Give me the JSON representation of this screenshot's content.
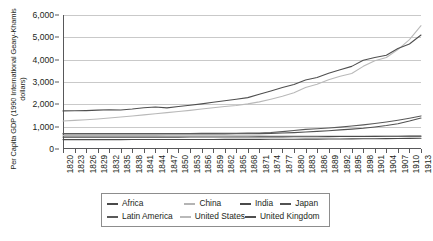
{
  "chart_data": {
    "type": "line",
    "title": "",
    "xlabel": "",
    "ylabel": "Per Capita GDP (1990 International Geary-Khamis dollars)",
    "ylim": [
      0,
      6000
    ],
    "xlim": [
      1820,
      1913
    ],
    "grid": true,
    "legend_position": "bottom",
    "y_ticks": [
      "0",
      "1,000",
      "2,000",
      "3,000",
      "4,000",
      "5,000",
      "6,000"
    ],
    "y_tick_values": [
      0,
      1000,
      2000,
      3000,
      4000,
      5000,
      6000
    ],
    "categories": [
      "1820",
      "1823",
      "1826",
      "1829",
      "1832",
      "1835",
      "1838",
      "1841",
      "1844",
      "1847",
      "1850",
      "1853",
      "1856",
      "1859",
      "1862",
      "1865",
      "1868",
      "1871",
      "1874",
      "1877",
      "1880",
      "1883",
      "1886",
      "1889",
      "1892",
      "1895",
      "1898",
      "1901",
      "1904",
      "1907",
      "1910",
      "1913"
    ],
    "series": [
      {
        "name": "Africa",
        "color": "#4a4a4a",
        "values": [
          420,
          420,
          421,
          421,
          422,
          422,
          423,
          424,
          424,
          425,
          425,
          426,
          427,
          428,
          429,
          430,
          431,
          432,
          434,
          436,
          438,
          440,
          442,
          445,
          448,
          452,
          456,
          460,
          465,
          470,
          475,
          480
        ]
      },
      {
        "name": "China",
        "color": "#b4b4b4",
        "values": [
          600,
          600,
          600,
          600,
          599,
          599,
          598,
          598,
          597,
          596,
          595,
          594,
          593,
          592,
          590,
          589,
          587,
          586,
          584,
          583,
          582,
          580,
          579,
          578,
          577,
          576,
          575,
          574,
          573,
          572,
          571,
          570
        ]
      },
      {
        "name": "India",
        "color": "#4a4a4a",
        "values": [
          533,
          533,
          533,
          533,
          533,
          533,
          533,
          533,
          533,
          533,
          533,
          534,
          535,
          536,
          537,
          538,
          540,
          541,
          543,
          545,
          547,
          549,
          551,
          554,
          557,
          560,
          563,
          566,
          569,
          572,
          575,
          577
        ]
      },
      {
        "name": "Japan",
        "color": "#525252",
        "values": [
          669,
          669,
          669,
          669,
          669,
          669,
          669,
          669,
          669,
          669,
          669,
          670,
          672,
          675,
          678,
          682,
          686,
          690,
          700,
          715,
          735,
          760,
          790,
          820,
          855,
          890,
          930,
          985,
          1050,
          1130,
          1250,
          1387
        ]
      },
      {
        "name": "Latin America",
        "color": "#5a5a5a",
        "values": [
          692,
          692,
          692,
          692,
          692,
          692,
          692,
          692,
          692,
          693,
          694,
          696,
          698,
          700,
          703,
          706,
          710,
          715,
          740,
          780,
          830,
          880,
          910,
          940,
          980,
          1030,
          1080,
          1140,
          1210,
          1290,
          1380,
          1481
        ]
      },
      {
        "name": "United States",
        "color": "#b9b9b9",
        "values": [
          1257,
          1280,
          1310,
          1345,
          1385,
          1430,
          1480,
          1530,
          1580,
          1630,
          1680,
          1730,
          1790,
          1850,
          1900,
          1950,
          2020,
          2110,
          2230,
          2360,
          2520,
          2750,
          2900,
          3100,
          3260,
          3380,
          3700,
          3950,
          4100,
          4450,
          4900,
          5520
        ]
      },
      {
        "name": "United Kingdom",
        "color": "#4f4f4f",
        "values": [
          1706,
          1710,
          1720,
          1740,
          1760,
          1745,
          1790,
          1850,
          1880,
          1840,
          1900,
          1960,
          2020,
          2090,
          2160,
          2230,
          2300,
          2450,
          2600,
          2750,
          2890,
          3090,
          3200,
          3390,
          3550,
          3700,
          3970,
          4100,
          4200,
          4500,
          4700,
          5104
        ]
      }
    ]
  },
  "legend": {
    "rows": [
      [
        {
          "label": "Africa",
          "color": "#4a4a4a",
          "width": 92
        },
        {
          "label": "China",
          "color": "#b4b4b4",
          "width": 66
        },
        {
          "label": "India",
          "color": "#4a4a4a",
          "width": 48
        },
        {
          "label": "Japan",
          "color": "#525252",
          "width": 52
        }
      ],
      [
        {
          "label": "Latin America",
          "color": "#5a5a5a",
          "width": 92
        },
        {
          "label": "United States",
          "color": "#b9b9b9",
          "width": 66
        },
        {
          "label": "United Kingdom",
          "color": "#4f4f4f",
          "width": 100
        }
      ]
    ]
  },
  "colors": {
    "axis": "#58585a",
    "gridline": "#c9c9c9",
    "text": "#231f20",
    "legend_border": "#8d8d8d",
    "background": "#ffffff"
  }
}
